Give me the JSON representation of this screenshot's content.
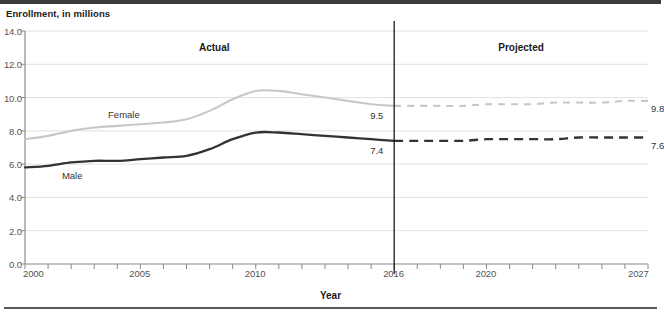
{
  "axis_title_y": "Enrollment, in millions",
  "axis_title_x": "Year",
  "period_labels": {
    "actual": "Actual",
    "projected": "Projected"
  },
  "series_labels": {
    "female": "Female",
    "male": "Male"
  },
  "point_labels": {
    "female_2016": "9.5",
    "male_2016": "7.4",
    "female_2027": "9.8",
    "male_2027": "7.6"
  },
  "colors": {
    "female_line": "#c8c8c8",
    "male_line": "#333333",
    "grid": "#e2e2e2",
    "axis": "#8a8a8a",
    "divider": "#1a1a1a",
    "text": "#1a1a1a"
  },
  "chart_data": {
    "type": "line",
    "title": "",
    "xlabel": "Year",
    "ylabel": "Enrollment, in millions",
    "xlim": [
      2000,
      2027
    ],
    "ylim": [
      0.0,
      14.0
    ],
    "ytick_labels": [
      "0.0",
      "2.0",
      "4.0",
      "6.0",
      "8.0",
      "10.0",
      "12.0",
      "14.0"
    ],
    "yticks": [
      0.0,
      2.0,
      4.0,
      6.0,
      8.0,
      10.0,
      12.0,
      14.0
    ],
    "xtick_labels": [
      "2000",
      "2005",
      "2010",
      "2016",
      "2020",
      "2027"
    ],
    "xticks": [
      2000,
      2005,
      2010,
      2016,
      2020,
      2027
    ],
    "minor_xticks_every": 1,
    "grid": "horizontal",
    "legend": "inline-labels",
    "actual_projected_divider_year": 2016,
    "x": [
      2000,
      2001,
      2002,
      2003,
      2004,
      2005,
      2006,
      2007,
      2008,
      2009,
      2010,
      2011,
      2012,
      2013,
      2014,
      2015,
      2016,
      2017,
      2018,
      2019,
      2020,
      2021,
      2022,
      2023,
      2024,
      2025,
      2026,
      2027
    ],
    "series": [
      {
        "name": "Female",
        "color": "#c8c8c8",
        "actual_through": 2016,
        "values": [
          7.5,
          7.7,
          8.0,
          8.2,
          8.3,
          8.4,
          8.5,
          8.7,
          9.2,
          9.9,
          10.4,
          10.4,
          10.2,
          10.0,
          9.8,
          9.6,
          9.5,
          9.5,
          9.5,
          9.5,
          9.6,
          9.6,
          9.6,
          9.7,
          9.7,
          9.7,
          9.8,
          9.8
        ]
      },
      {
        "name": "Male",
        "color": "#333333",
        "actual_through": 2016,
        "values": [
          5.8,
          5.9,
          6.1,
          6.2,
          6.2,
          6.3,
          6.4,
          6.5,
          6.9,
          7.5,
          7.9,
          7.9,
          7.8,
          7.7,
          7.6,
          7.5,
          7.4,
          7.4,
          7.4,
          7.4,
          7.5,
          7.5,
          7.5,
          7.5,
          7.6,
          7.6,
          7.6,
          7.6
        ]
      }
    ],
    "annotations": [
      {
        "text": "Actual",
        "x": 2008.2,
        "y": 13.0
      },
      {
        "text": "Projected",
        "x": 2021.5,
        "y": 13.0
      },
      {
        "text": "Female",
        "x": 2003.8,
        "y": 8.9
      },
      {
        "text": "Male",
        "x": 2001.8,
        "y": 5.4
      },
      {
        "text": "9.5",
        "x": 2016,
        "y": 9.5
      },
      {
        "text": "7.4",
        "x": 2016,
        "y": 7.4
      },
      {
        "text": "9.8",
        "x": 2027,
        "y": 9.8
      },
      {
        "text": "7.6",
        "x": 2027,
        "y": 7.6
      }
    ]
  }
}
